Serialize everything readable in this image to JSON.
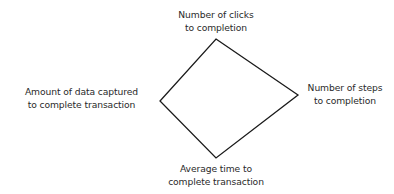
{
  "diagram": {
    "type": "diamond",
    "stroke_color": "#1a1a1a",
    "background": "#ffffff",
    "vertices": {
      "top": [
        216,
        39
      ],
      "right": [
        298,
        95
      ],
      "bottom": [
        216,
        158
      ],
      "left": [
        160,
        101
      ]
    },
    "labels": {
      "top": {
        "line1": "Number of clicks",
        "line2": "to completion"
      },
      "left": {
        "line1": "Amount of data captured",
        "line2": "to complete transaction"
      },
      "right": {
        "line1": "Number of steps",
        "line2": "to completion"
      },
      "bottom": {
        "line1": "Average time to",
        "line2": "complete transaction"
      }
    }
  }
}
